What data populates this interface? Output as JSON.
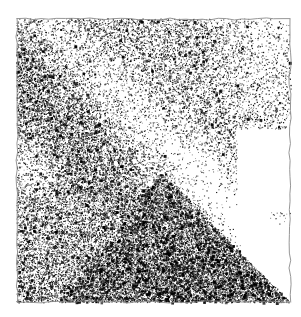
{
  "artwork": {
    "title": "Stippled grayscale abstract composition",
    "medium": "black stipple dots on white ground",
    "canvas": {
      "width": 301,
      "height": 317,
      "background": "#ffffff",
      "ink": "#000000"
    },
    "panel": {
      "name": "bordered square panel",
      "left": 17,
      "top": 19,
      "right": 290,
      "bottom": 302,
      "border_style": "hand-drawn wavy thin line",
      "border_color": "#8a8a8a"
    },
    "regions": [
      {
        "name": "upper-left dark field",
        "tone": "medium-dark",
        "density": 0.52,
        "description": "dense stipple filling the top-left quadrant"
      },
      {
        "name": "light diagonal band",
        "tone": "light",
        "density": 0.18,
        "description": "bright wedge sweeping from upper-left edge down toward center-right"
      },
      {
        "name": "dark triangle",
        "tone": "very dark",
        "density": 0.82,
        "apex_x": 160,
        "apex_y": 172,
        "description": "solid dark triangle with apex near image center, base along the bottom edge, hypotenuse running to the bottom-right corner"
      },
      {
        "name": "upper-right fade",
        "tone": "light",
        "density": 0.22,
        "description": "stipple density falls off toward the right border"
      },
      {
        "name": "left edge highlight",
        "tone": "very light",
        "density": 0.1,
        "description": "pale vertical patch hugging the left border near mid-height"
      },
      {
        "name": "white notch",
        "tone": "blank",
        "density": 0.0,
        "left": 237,
        "top": 128,
        "right": 290,
        "bottom": 212,
        "description": "clean white rectangle cut out of the right side of the panel"
      },
      {
        "name": "bottom-right white wedge",
        "tone": "light",
        "density": 0.12,
        "description": "lighter triangular area between the dark triangle hypotenuse and the right border"
      }
    ]
  },
  "chart_data": {
    "type": "heatmap",
    "xlabel": "",
    "ylabel": "",
    "grid": false,
    "legend": "none",
    "xlim": [
      0,
      301
    ],
    "ylim": [
      0,
      317
    ],
    "field_points": [
      {
        "x": 40,
        "y": 40,
        "value": 0.5
      },
      {
        "x": 110,
        "y": 40,
        "value": 0.46
      },
      {
        "x": 180,
        "y": 40,
        "value": 0.4
      },
      {
        "x": 255,
        "y": 40,
        "value": 0.26
      },
      {
        "x": 40,
        "y": 95,
        "value": 0.58
      },
      {
        "x": 110,
        "y": 95,
        "value": 0.44
      },
      {
        "x": 180,
        "y": 95,
        "value": 0.34
      },
      {
        "x": 255,
        "y": 95,
        "value": 0.2
      },
      {
        "x": 40,
        "y": 160,
        "value": 0.16
      },
      {
        "x": 110,
        "y": 160,
        "value": 0.5
      },
      {
        "x": 180,
        "y": 160,
        "value": 0.26
      },
      {
        "x": 255,
        "y": 160,
        "value": 0.0
      },
      {
        "x": 40,
        "y": 230,
        "value": 0.44
      },
      {
        "x": 110,
        "y": 230,
        "value": 0.72
      },
      {
        "x": 180,
        "y": 230,
        "value": 0.84
      },
      {
        "x": 255,
        "y": 230,
        "value": 0.12
      },
      {
        "x": 40,
        "y": 285,
        "value": 0.6
      },
      {
        "x": 110,
        "y": 285,
        "value": 0.86
      },
      {
        "x": 180,
        "y": 285,
        "value": 0.88
      },
      {
        "x": 255,
        "y": 285,
        "value": 0.62
      }
    ]
  }
}
